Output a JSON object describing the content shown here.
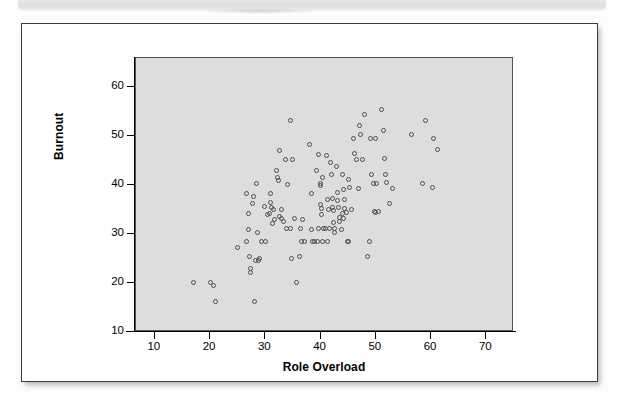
{
  "figure": {
    "background_color": "#ffffff",
    "frame_border_color": "#3c3c3c"
  },
  "chart_data": {
    "type": "scatter",
    "title": "",
    "xlabel": "Role Overload",
    "ylabel": "Burnout",
    "xlim": [
      6.6,
      75.0
    ],
    "ylim": [
      10.0,
      65.9
    ],
    "xticks": [
      10,
      20,
      30,
      40,
      50,
      60,
      70
    ],
    "yticks": [
      10,
      20,
      30,
      40,
      50,
      60
    ],
    "grid": false,
    "legend": null,
    "plot_background_color": "#dddddd",
    "marker": {
      "shape": "open-circle",
      "edge_color": "#4c4c4c",
      "fill": "none",
      "size_px": 5
    },
    "n_points": 134,
    "points": [
      [
        17.0,
        20.1
      ],
      [
        20.0,
        20.1
      ],
      [
        20.6,
        19.4
      ],
      [
        21.0,
        16.3
      ],
      [
        24.9,
        27.3
      ],
      [
        26.6,
        28.4
      ],
      [
        26.6,
        38.2
      ],
      [
        26.9,
        34.2
      ],
      [
        26.9,
        31.0
      ],
      [
        27.2,
        25.4
      ],
      [
        27.3,
        23.0
      ],
      [
        27.4,
        22.2
      ],
      [
        27.7,
        36.3
      ],
      [
        27.9,
        37.7
      ],
      [
        28.0,
        16.3
      ],
      [
        28.4,
        40.2
      ],
      [
        28.5,
        30.2
      ],
      [
        28.7,
        24.6
      ],
      [
        28.9,
        25.0
      ],
      [
        29.3,
        28.4
      ],
      [
        30.0,
        28.4
      ],
      [
        30.7,
        34.2
      ],
      [
        30.9,
        38.2
      ],
      [
        31.0,
        36.4
      ],
      [
        31.1,
        35.4
      ],
      [
        31.3,
        32.2
      ],
      [
        31.5,
        35.0
      ],
      [
        31.7,
        32.9
      ],
      [
        32.0,
        43.0
      ],
      [
        32.2,
        41.5
      ],
      [
        32.4,
        41.0
      ],
      [
        32.5,
        47.1
      ],
      [
        32.6,
        33.6
      ],
      [
        32.9,
        33.1
      ],
      [
        33.2,
        32.5
      ],
      [
        33.6,
        45.1
      ],
      [
        33.9,
        31.2
      ],
      [
        34.1,
        40.1
      ],
      [
        34.6,
        53.2
      ],
      [
        35.0,
        45.1
      ],
      [
        35.6,
        20.1
      ],
      [
        36.1,
        25.4
      ],
      [
        36.3,
        31.2
      ],
      [
        36.5,
        28.4
      ],
      [
        37.0,
        28.4
      ],
      [
        38.0,
        48.2
      ],
      [
        38.3,
        31.0
      ],
      [
        38.4,
        38.3
      ],
      [
        38.5,
        28.4
      ],
      [
        38.9,
        28.4
      ],
      [
        39.2,
        43.0
      ],
      [
        39.6,
        46.2
      ],
      [
        39.7,
        31.2
      ],
      [
        39.9,
        40.2
      ],
      [
        40.0,
        39.9
      ],
      [
        40.0,
        36.0
      ],
      [
        40.1,
        35.1
      ],
      [
        40.2,
        34.0
      ],
      [
        40.3,
        41.5
      ],
      [
        40.4,
        28.4
      ],
      [
        40.6,
        31.2
      ],
      [
        40.8,
        31.2
      ],
      [
        41.0,
        46.0
      ],
      [
        41.3,
        37.0
      ],
      [
        41.4,
        35.0
      ],
      [
        41.6,
        31.1
      ],
      [
        41.8,
        44.5
      ],
      [
        42.0,
        42.1
      ],
      [
        42.1,
        37.3
      ],
      [
        42.2,
        35.3
      ],
      [
        42.3,
        34.8
      ],
      [
        42.4,
        32.3
      ],
      [
        42.5,
        31.2
      ],
      [
        42.6,
        30.4
      ],
      [
        42.8,
        43.8
      ],
      [
        43.0,
        38.5
      ],
      [
        43.1,
        36.9
      ],
      [
        43.2,
        35.3
      ],
      [
        43.4,
        33.4
      ],
      [
        43.5,
        32.6
      ],
      [
        43.7,
        31.0
      ],
      [
        44.0,
        42.1
      ],
      [
        44.2,
        39.1
      ],
      [
        44.3,
        37.0
      ],
      [
        44.4,
        35.1
      ],
      [
        44.6,
        34.4
      ],
      [
        44.8,
        28.4
      ],
      [
        45.0,
        41.2
      ],
      [
        45.3,
        39.4
      ],
      [
        45.6,
        35.0
      ],
      [
        46.0,
        49.5
      ],
      [
        46.2,
        46.4
      ],
      [
        46.5,
        45.2
      ],
      [
        46.8,
        39.2
      ],
      [
        47.0,
        52.1
      ],
      [
        47.3,
        50.3
      ],
      [
        48.0,
        54.3
      ],
      [
        48.5,
        25.4
      ],
      [
        48.8,
        28.4
      ],
      [
        49.0,
        49.4
      ],
      [
        49.3,
        42.2
      ],
      [
        49.5,
        40.3
      ],
      [
        49.8,
        34.6
      ],
      [
        49.9,
        34.4
      ],
      [
        50.0,
        49.4
      ],
      [
        50.2,
        40.2
      ],
      [
        50.5,
        34.5
      ],
      [
        51.0,
        55.3
      ],
      [
        51.3,
        51.1
      ],
      [
        51.5,
        45.3
      ],
      [
        51.8,
        42.2
      ],
      [
        52.0,
        40.4
      ],
      [
        52.5,
        36.2
      ],
      [
        53.0,
        39.3
      ],
      [
        56.5,
        50.3
      ],
      [
        58.5,
        40.3
      ],
      [
        59.0,
        53.2
      ],
      [
        60.2,
        39.5
      ],
      [
        60.5,
        49.5
      ],
      [
        61.2,
        47.3
      ],
      [
        33.0,
        35.0
      ],
      [
        34.5,
        31.1
      ],
      [
        35.2,
        33.2
      ],
      [
        36.8,
        33.0
      ],
      [
        29.8,
        35.6
      ],
      [
        30.4,
        33.9
      ],
      [
        43.9,
        34.1
      ],
      [
        44.1,
        33.2
      ],
      [
        45.1,
        28.4
      ],
      [
        39.4,
        28.4
      ],
      [
        41.2,
        28.4
      ],
      [
        34.8,
        24.9
      ],
      [
        28.2,
        24.6
      ],
      [
        47.5,
        45.2
      ]
    ]
  },
  "axes": {
    "y_tick_labels": [
      "60",
      "50",
      "40",
      "30",
      "20",
      "10"
    ],
    "x_tick_labels": [
      "10",
      "20",
      "30",
      "40",
      "50",
      "60",
      "70"
    ]
  }
}
